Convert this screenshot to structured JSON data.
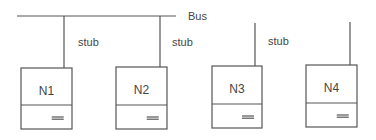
{
  "diagram": {
    "bus": {
      "label": "Bus",
      "x1": 17,
      "x2": 176,
      "y": 16,
      "label_x": 188,
      "label_y": 20
    },
    "nodes": [
      {
        "label": "N1",
        "x": 21,
        "y": 68,
        "w": 51,
        "h": 61,
        "divider": 105,
        "stub_x": 64,
        "stub_top": 16,
        "connected": true
      },
      {
        "label": "N2",
        "x": 116,
        "y": 67,
        "w": 51,
        "h": 62,
        "divider": 105,
        "stub_x": 160,
        "stub_top": 16,
        "connected": true
      },
      {
        "label": "N3",
        "x": 212,
        "y": 66,
        "w": 50,
        "h": 62,
        "divider": 104,
        "stub_x": 255,
        "stub_top": 23,
        "connected": false
      },
      {
        "label": "N4",
        "x": 306,
        "y": 65,
        "w": 51,
        "h": 62,
        "divider": 103,
        "stub_x": 350,
        "stub_top": 22,
        "connected": false
      }
    ],
    "stub_labels": [
      {
        "text": "stub",
        "x": 78,
        "y": 46
      },
      {
        "text": "stub",
        "x": 172,
        "y": 46
      },
      {
        "text": "stub",
        "x": 268,
        "y": 45
      }
    ]
  }
}
